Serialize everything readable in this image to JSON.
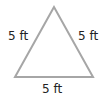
{
  "diagram": {
    "shape": "equilateral-triangle",
    "stroke_color": "#a6a6a6",
    "fill_color": "#ffffff",
    "vertices": [
      [
        54,
        7
      ],
      [
        15,
        77
      ],
      [
        93,
        77
      ]
    ],
    "labels": {
      "left_side": "5 ft",
      "right_side": "5 ft",
      "bottom_side": "5 ft"
    }
  }
}
